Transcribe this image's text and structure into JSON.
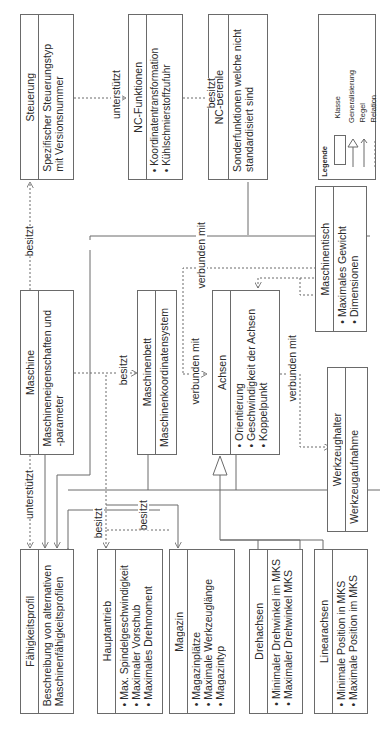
{
  "diagram": {
    "type": "UML class diagram (rotated 90°)",
    "classes": [
      {
        "id": "steuerung",
        "name": "Steuerung",
        "attributes": "Spezifischer Steuerungstyp\nmit Versionsnummer"
      },
      {
        "id": "nc_funktionen",
        "name": "NC-Funktionen",
        "attributes": "• Koordinatentransformation\n• Kühlschmierstoffzufuhr"
      },
      {
        "id": "nc_befehle",
        "name": "NC-Befehle",
        "attributes": "Sonderfunktionen welche nicht\nstandardisiert sind"
      },
      {
        "id": "maschine",
        "name": "Maschine",
        "attributes": "Maschineneigenschaften und\n-parameter"
      },
      {
        "id": "maschinenbett",
        "name": "Maschinenbett",
        "attributes": "Maschinenkoordinatensystem"
      },
      {
        "id": "achsen",
        "name": "Achsen",
        "attributes": "• Orientierung\n• Geschwindigkeit der Achsen\n• Koppelpunkt"
      },
      {
        "id": "maschinentisch",
        "name": "Maschinentisch",
        "attributes": "• Maximales Gewicht\n• Dimensionen"
      },
      {
        "id": "werkzeughalter",
        "name": "Werkzeughalter",
        "attributes": "Werkzeugaufnahme"
      },
      {
        "id": "faehigkeitsprofil",
        "name": "Fähigkeitsprofil",
        "attributes": "Beschreibung von alternativen\nMaschinenfähigkeitsprofilen"
      },
      {
        "id": "hauptantrieb",
        "name": "Hauptantrieb",
        "attributes": "• Max. Spindelgeschwindigkeit\n• Maximaler Vorschub\n• Maximales Drehmoment"
      },
      {
        "id": "magazin",
        "name": "Magazin",
        "attributes": "• Magazinplätze\n• Maximale Werkzeuglänge\n• Magazintyp"
      },
      {
        "id": "drehachsen",
        "name": "Drehachsen",
        "attributes": "• Minimaler Drehwinkel im MKS\n• Maximaler Drehwinkel MKS"
      },
      {
        "id": "linearachsen",
        "name": "Linearachsen",
        "attributes": "• Minimale Position in MKS\n• Maximale Position im MKS"
      }
    ],
    "relation_labels": {
      "steuerung_nc_funktionen": "unterstützt",
      "nc_funktionen_nc_befehle": "besitzt",
      "maschine_steuerung": "besitzt",
      "maschine_maschinenbett": "besitzt",
      "maschine_faehigkeitsprofil": "unterstützt",
      "verbunden_top": "verbunden mit",
      "verbunden_bett_achsen": "verbunden mit",
      "verbunden_achsen_werkzeughalter": "verbunden mit",
      "besitzt_hauptantrieb": "besitzt",
      "besitzt_magazin": "besitzt"
    },
    "legend": {
      "title": "Legende",
      "klasse": "Klasse",
      "generalisierung": "Generalisierung",
      "regel": "Regel",
      "relation": "Relation",
      "mks_abbr": "MKS:",
      "mks_text": "Maschinenkoo-\ndinatensystem"
    },
    "colors": {
      "line": "#6a6a6a",
      "text": "#2b2b2b",
      "background": "#ffffff"
    }
  }
}
